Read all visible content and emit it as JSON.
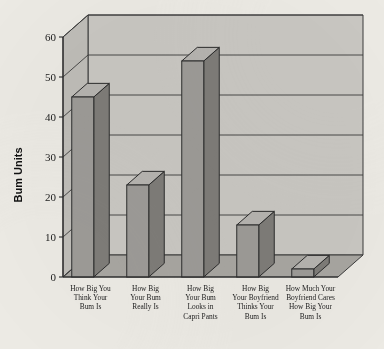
{
  "chart_data": {
    "type": "bar",
    "title": "",
    "subtitle": "",
    "xlabel": "",
    "ylabel": "Bum Units",
    "ylim": [
      0,
      60
    ],
    "yticks": [
      0,
      10,
      20,
      30,
      40,
      50,
      60
    ],
    "ytick_labels": [
      "0",
      "10",
      "20",
      "30",
      "40",
      "50",
      "60"
    ],
    "grid": true,
    "legend": false,
    "legend_position": "none",
    "style": "3d-column",
    "categories": [
      "How Big You Think Your Bum Is",
      "How Big Your Bum Really Is",
      "How Big Your Bum Looks in Capri Pants",
      "How Big Your Boyfriend Thinks Your Bum Is",
      "How Much Your Boyfriend Cares How Big Your Bum Is"
    ],
    "category_lines": [
      [
        "How Big You",
        "Think Your",
        "Bum Is"
      ],
      [
        "How Big",
        "Your Bum",
        "Really Is"
      ],
      [
        "How Big",
        "Your Bum",
        "Looks in",
        "Capri Pants"
      ],
      [
        "How Big",
        "Your Boyfriend",
        "Thinks Your",
        "Bum Is"
      ],
      [
        "How Much Your",
        "Boyfriend Cares",
        "How Big Your",
        "Bum Is"
      ]
    ],
    "values": [
      45,
      23,
      54,
      13,
      2
    ]
  },
  "colors": {
    "page_background": "#eceae4",
    "wall": "#c9c7c2",
    "side_wall": "#bfbdb8",
    "floor": "#a8a6a1",
    "bar_front": "#9d9b97",
    "bar_side": "#7e7c78",
    "bar_top": "#b6b4b0",
    "outline": "#2c2c2c",
    "text": "#1c1c1c"
  }
}
